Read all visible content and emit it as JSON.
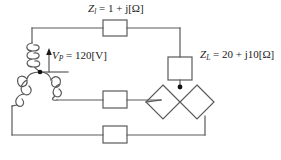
{
  "diagram": {
    "stroke_color": "#5a5a5a",
    "node_color": "#111111",
    "text_color": "#1a1a1a",
    "background": "#ffffff"
  },
  "labels": {
    "line_impedance": {
      "symbol": "Z",
      "subscript": "l",
      "equals": "=",
      "value": "1 + j",
      "unit": "[Ω]",
      "full_text": "Zₗ = 1 + j[Ω]"
    },
    "source_voltage": {
      "symbol": "V",
      "subscript": "P",
      "equals": "=",
      "value": "120",
      "unit": "[V]",
      "full_text": "Vₚ = 120[V]"
    },
    "load_impedance": {
      "symbol": "Z",
      "subscript": "L",
      "equals": "=",
      "value": "20 + j10",
      "unit": "[Ω]",
      "full_text": "Zʟ = 20 + j10[Ω]"
    }
  },
  "components": {
    "line_impedance_boxes": [
      {
        "name": "top-line-impedance",
        "shape": "rectangle"
      },
      {
        "name": "middle-line-impedance",
        "shape": "rectangle"
      },
      {
        "name": "bottom-line-impedance",
        "shape": "rectangle"
      }
    ],
    "load_boxes": [
      {
        "name": "load-impedance-vertical",
        "shape": "rectangle"
      },
      {
        "name": "load-impedance-diamond-left",
        "shape": "diamond"
      },
      {
        "name": "load-impedance-diamond-right",
        "shape": "diamond"
      }
    ],
    "source": {
      "name": "wye-connected-three-phase-source",
      "winding_count": 3,
      "neutral_node": true
    },
    "arrows": [
      {
        "name": "source-voltage-polarity-arrow",
        "direction": "up"
      }
    ],
    "nodes": [
      {
        "name": "source-neutral-node"
      },
      {
        "name": "load-top-junction-node"
      }
    ]
  }
}
